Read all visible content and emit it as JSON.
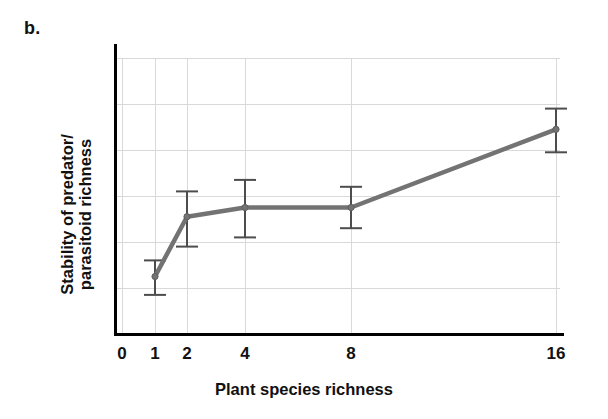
{
  "panel": {
    "label": "b."
  },
  "axis_titles": {
    "y_line1": "Stability of predator/",
    "y_line2": "parasitoid richness",
    "x": "Plant species richness"
  },
  "colors": {
    "series": "#737373",
    "error_bar": "#4d4d4d",
    "axis": "#000000",
    "grid": "#d9d9d9",
    "text": "#111111",
    "background": "#ffffff"
  },
  "chart_data": {
    "type": "line",
    "title": "",
    "subtitle": "",
    "xlabel": "Plant species richness",
    "ylabel": "Stability of predator/ parasitoid richness",
    "xticklabels": [
      "0",
      "1",
      "2",
      "4",
      "8",
      "16"
    ],
    "xtickvalues": [
      0,
      1,
      2,
      4,
      8,
      16
    ],
    "yticklabels": [
      "1.7",
      "1.9",
      "2.1",
      "2.3",
      "2.5",
      "2.7",
      "2.9"
    ],
    "ytickvalues": [
      1.7,
      1.9,
      2.1,
      2.3,
      2.5,
      2.7,
      2.9
    ],
    "ylim": [
      1.7,
      2.9
    ],
    "xscale": "log2-like categorical",
    "grid": true,
    "legend": "none",
    "x": [
      1,
      2,
      4,
      8,
      16
    ],
    "values": [
      1.95,
      2.21,
      2.25,
      2.25,
      2.59
    ],
    "error_upper": [
      2.02,
      2.32,
      2.37,
      2.34,
      2.68
    ],
    "error_lower": [
      1.87,
      2.08,
      2.12,
      2.16,
      2.49
    ],
    "markers": "circle",
    "series": [
      {
        "name": "Stability of predator/parasitoid richness",
        "values": [
          1.95,
          2.21,
          2.25,
          2.25,
          2.59
        ]
      }
    ]
  }
}
